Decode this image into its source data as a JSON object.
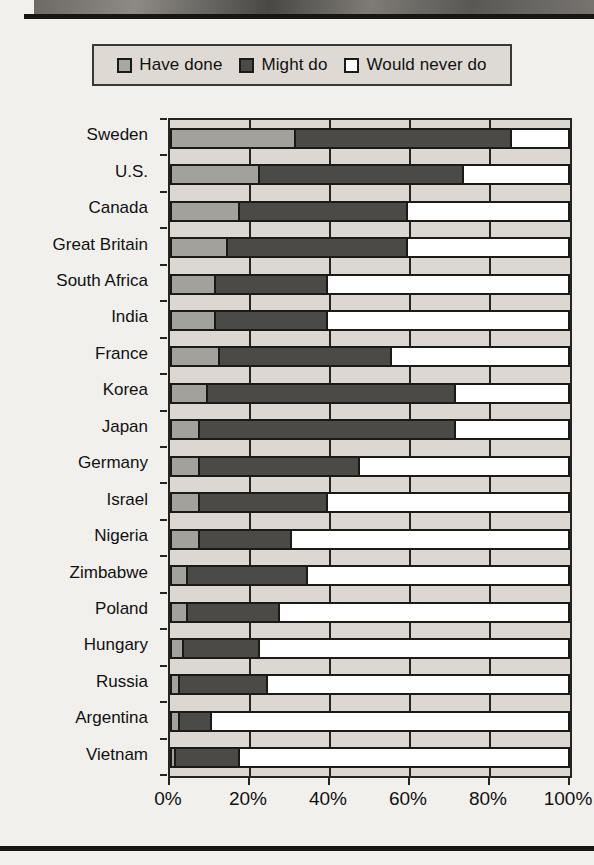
{
  "legend": {
    "items": [
      {
        "label": "Have done",
        "icon": "square-swatch-light",
        "color": "#a3a19c"
      },
      {
        "label": "Might do",
        "icon": "square-swatch-dark",
        "color": "#4b4a47"
      },
      {
        "label": "Would never do",
        "icon": "square-swatch-white",
        "color": "#ffffff"
      }
    ]
  },
  "axis": {
    "x_ticks": [
      "0%",
      "20%",
      "40%",
      "60%",
      "80%",
      "100%"
    ],
    "x_values": [
      0,
      20,
      40,
      60,
      80,
      100
    ]
  },
  "chart_data": {
    "type": "bar",
    "orientation": "horizontal",
    "stacked": true,
    "title": "",
    "xlabel": "",
    "ylabel": "",
    "xlim": [
      0,
      100
    ],
    "grid": true,
    "legend_position": "top",
    "categories": [
      "Sweden",
      "U.S.",
      "Canada",
      "Great Britain",
      "South Africa",
      "India",
      "France",
      "Korea",
      "Japan",
      "Germany",
      "Israel",
      "Nigeria",
      "Zimbabwe",
      "Poland",
      "Hungary",
      "Russia",
      "Argentina",
      "Vietnam"
    ],
    "series": [
      {
        "name": "Have done",
        "color": "#a3a19c",
        "values": [
          31,
          22,
          17,
          14,
          11,
          11,
          12,
          9,
          7,
          7,
          7,
          7,
          4,
          4,
          3,
          2,
          2,
          1
        ]
      },
      {
        "name": "Might do",
        "color": "#4b4a47",
        "values": [
          54,
          51,
          42,
          45,
          28,
          28,
          43,
          62,
          64,
          40,
          32,
          23,
          30,
          23,
          19,
          22,
          8,
          16
        ]
      },
      {
        "name": "Would never do",
        "color": "#ffffff",
        "values": [
          15,
          27,
          41,
          41,
          61,
          61,
          45,
          29,
          29,
          53,
          61,
          70,
          66,
          73,
          78,
          76,
          90,
          83
        ]
      }
    ]
  }
}
